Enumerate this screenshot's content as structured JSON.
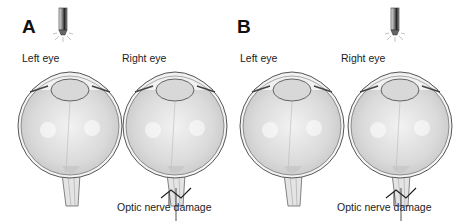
{
  "panels": [
    {
      "letter": "A",
      "light_on": "left",
      "eyes": [
        {
          "label": "Left eye",
          "damage": false
        },
        {
          "label": "Right eye",
          "damage": true
        }
      ],
      "damage_label": "Optic nerve damage"
    },
    {
      "letter": "B",
      "light_on": "right",
      "eyes": [
        {
          "label": "Left eye",
          "damage": false
        },
        {
          "label": "Right eye",
          "damage": true
        }
      ],
      "damage_label": "Optic nerve damage"
    }
  ],
  "colors": {
    "eye_fill": "#dcdcdc",
    "eye_outline": "#555555",
    "penlight": "#444444",
    "text": "#222222"
  }
}
